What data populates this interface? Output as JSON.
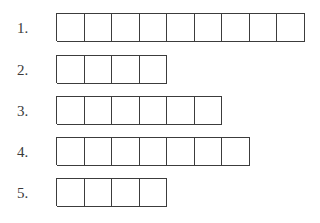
{
  "rows": [
    {
      "label": "1.",
      "boxes": 9,
      "top": 13
    },
    {
      "label": "2.",
      "boxes": 4,
      "top": 55
    },
    {
      "label": "3.",
      "boxes": 6,
      "top": 96
    },
    {
      "label": "4.",
      "boxes": 7,
      "top": 137
    },
    {
      "label": "5.",
      "boxes": 4,
      "top": 178
    }
  ]
}
